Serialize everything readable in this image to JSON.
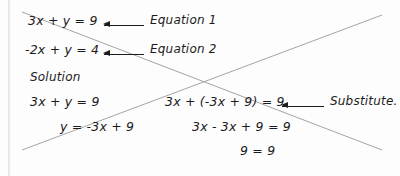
{
  "figure": {
    "kind": "math-worked-example",
    "topic": "Solving a system of linear equations by substitution",
    "ink_color": "#1c1c1c",
    "overlay_line_color": "#9a9a9a",
    "background_color": "#fdfdfd"
  },
  "system": {
    "equation1": {
      "expression": "3x + y = 9",
      "callout": "Equation 1",
      "arrow_icon": "left-arrow-icon"
    },
    "equation2": {
      "expression": "-2x + y = 4",
      "callout": "Equation 2",
      "arrow_icon": "left-arrow-icon"
    }
  },
  "solution": {
    "heading": "Solution",
    "left_column": [
      "3x + y = 9",
      "y = -3x + 9"
    ],
    "right_column": [
      "3x + (-3x + 9) = 9",
      "3x - 3x + 9 = 9",
      "9 = 9"
    ],
    "substitute_callout": {
      "label": "Substitute.",
      "arrow_icon": "left-arrow-icon"
    }
  },
  "overlay": {
    "descending_line": "diagonal-line-descending",
    "ascending_line": "diagonal-line-ascending",
    "page_edge": "page-margin-rule"
  }
}
